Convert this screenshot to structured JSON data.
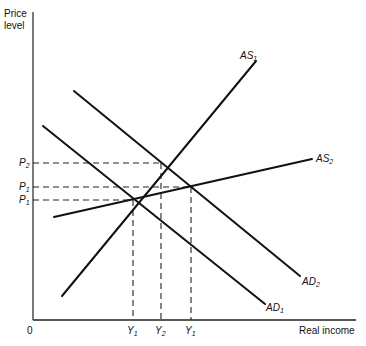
{
  "diagram": {
    "type": "AS-AD diagram",
    "y_axis_label_line1": "Price",
    "y_axis_label_line2": "level",
    "x_axis_label": "Real income",
    "origin_label": "0",
    "curves": [
      {
        "name": "AS",
        "sub": "1"
      },
      {
        "name": "AS",
        "sub": "2"
      },
      {
        "name": "AD",
        "sub": "1"
      },
      {
        "name": "AD",
        "sub": "2"
      }
    ],
    "price_levels": [
      {
        "name": "P",
        "sub": "2"
      },
      {
        "name": "P",
        "sub": "1"
      },
      {
        "name": "P",
        "sub": "1"
      }
    ],
    "income_levels": [
      {
        "name": "Y",
        "sub": "1"
      },
      {
        "name": "Y",
        "sub": "2"
      },
      {
        "name": "Y",
        "sub": "1"
      }
    ],
    "line_color": "#111111"
  }
}
